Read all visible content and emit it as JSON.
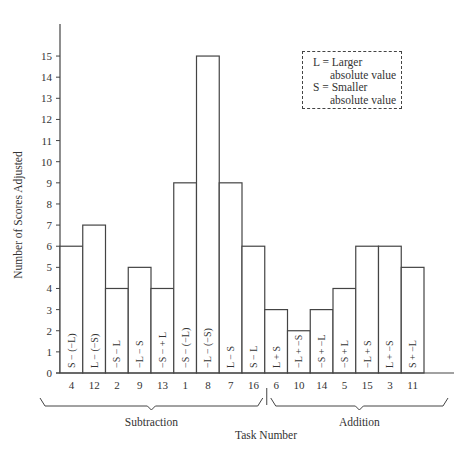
{
  "chart_data": {
    "type": "bar",
    "title": "",
    "xlabel": "Task Number",
    "ylabel": "Number of Scores Adjusted",
    "ylim": [
      0,
      16
    ],
    "yticks": [
      0,
      1,
      2,
      3,
      4,
      5,
      6,
      7,
      8,
      9,
      10,
      11,
      12,
      13,
      14,
      15
    ],
    "grid": false,
    "categories": [
      "4",
      "12",
      "2",
      "9",
      "13",
      "1",
      "8",
      "7",
      "16",
      "6",
      "10",
      "14",
      "5",
      "15",
      "3",
      "11"
    ],
    "values": [
      6,
      7,
      4,
      5,
      4,
      9,
      15,
      9,
      6,
      3,
      2,
      3,
      4,
      6,
      6,
      5
    ],
    "bar_labels": [
      "S − (−L)",
      "L − (−S)",
      "−S − L",
      "−L − S",
      "−S − + L",
      "−S − (−L)",
      "−L − (−S)",
      "L − S",
      "S − L",
      "L + S",
      "−L + −S",
      "−S + −L",
      "−S + L",
      "−L + S",
      "L + −S",
      "S + −L"
    ],
    "groups": [
      {
        "name": "Subtraction",
        "tasks": [
          "4",
          "12",
          "2",
          "9",
          "13",
          "1",
          "8",
          "7",
          "16"
        ]
      },
      {
        "name": "Addition",
        "tasks": [
          "6",
          "10",
          "14",
          "5",
          "15",
          "3",
          "11"
        ]
      }
    ],
    "legend": {
      "position": "top-right",
      "entries": [
        {
          "key": "L",
          "line1": "L = Larger",
          "line2": "absolute value"
        },
        {
          "key": "S",
          "line1": "S = Smaller",
          "line2": "absolute value"
        }
      ]
    }
  }
}
